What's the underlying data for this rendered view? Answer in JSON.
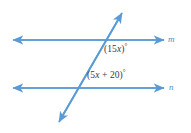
{
  "figure": {
    "background_color": "#ffffff",
    "line_color": "#5b9bd5",
    "text_color": "#3a3a3a",
    "label_color": "#4a8fc0"
  },
  "lines": {
    "m": {
      "name": "m",
      "y": 40,
      "x_start": 12,
      "x_end": 165,
      "arrows": "both"
    },
    "n": {
      "name": "n",
      "y": 88,
      "x_start": 12,
      "x_end": 165,
      "arrows": "both"
    },
    "transversal": {
      "name": "transversal",
      "x1": 58,
      "y1": 123,
      "x2": 123,
      "y2": 11,
      "arrows": "both"
    }
  },
  "angles": [
    {
      "id": "angle-top",
      "open_paren": "(",
      "coefficient": "15",
      "variable": "x",
      "close_paren": ")",
      "degree": "°",
      "full_text": "(15x)°",
      "value_expression": "15x",
      "position": {
        "x": 104,
        "y": 45
      },
      "on_line": "m"
    },
    {
      "id": "angle-bottom",
      "open_paren": "(",
      "coefficient": "5",
      "variable": "x",
      "operator": " + ",
      "constant": "20",
      "close_paren": ")",
      "degree": "°",
      "full_text": "(5x + 20)°",
      "value_expression": "5x + 20",
      "position": {
        "x": 87,
        "y": 71
      },
      "on_line": "n"
    }
  ]
}
